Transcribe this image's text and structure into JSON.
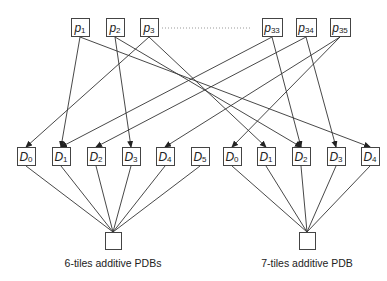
{
  "diagram": {
    "patterns": [
      {
        "id": "p1",
        "base": "p",
        "sub": "1",
        "cx": 80
      },
      {
        "id": "p2",
        "base": "p",
        "sub": "2",
        "cx": 115
      },
      {
        "id": "p3",
        "base": "p",
        "sub": "3",
        "cx": 149
      },
      {
        "id": "p33",
        "base": "p",
        "sub": "33",
        "cx": 272
      },
      {
        "id": "p34",
        "base": "p",
        "sub": "34",
        "cx": 306
      },
      {
        "id": "p35",
        "base": "p",
        "sub": "35",
        "cx": 340
      }
    ],
    "ellipsis": {
      "x1": 162,
      "x2": 252,
      "y": 28,
      "style": "dotted"
    },
    "left_group": {
      "databases": [
        {
          "id": "L0",
          "base": "D",
          "sub": "0",
          "cx": 26
        },
        {
          "id": "L1",
          "base": "D",
          "sub": "1",
          "cx": 61
        },
        {
          "id": "L2",
          "base": "D",
          "sub": "2",
          "cx": 96
        },
        {
          "id": "L3",
          "base": "D",
          "sub": "3",
          "cx": 131
        },
        {
          "id": "L4",
          "base": "D",
          "sub": "4",
          "cx": 165
        },
        {
          "id": "L5",
          "base": "D",
          "sub": "5",
          "cx": 200
        }
      ],
      "sink_cx": 113,
      "caption": "6-tiles additive PDBs"
    },
    "right_group": {
      "databases": [
        {
          "id": "R0",
          "base": "D",
          "sub": "0",
          "cx": 232
        },
        {
          "id": "R1",
          "base": "D",
          "sub": "1",
          "cx": 266
        },
        {
          "id": "R2",
          "base": "D",
          "sub": "2",
          "cx": 301
        },
        {
          "id": "R3",
          "base": "D",
          "sub": "3",
          "cx": 336
        },
        {
          "id": "R4",
          "base": "D",
          "sub": "4",
          "cx": 370
        }
      ],
      "sink_cx": 307,
      "caption": "7-tiles additive PDB"
    },
    "edges": [
      [
        "p1",
        "L1"
      ],
      [
        "p1",
        "R4"
      ],
      [
        "p2",
        "L3"
      ],
      [
        "p2",
        "R2"
      ],
      [
        "p3",
        "L0"
      ],
      [
        "p3",
        "R1"
      ],
      [
        "p33",
        "L1"
      ],
      [
        "p33",
        "R2"
      ],
      [
        "p34",
        "L2"
      ],
      [
        "p34",
        "R3"
      ],
      [
        "p35",
        "L4"
      ],
      [
        "p35",
        "R0"
      ]
    ],
    "colors": {
      "stroke": "#333333",
      "box_border": "#444444",
      "dots": "#999999"
    }
  }
}
